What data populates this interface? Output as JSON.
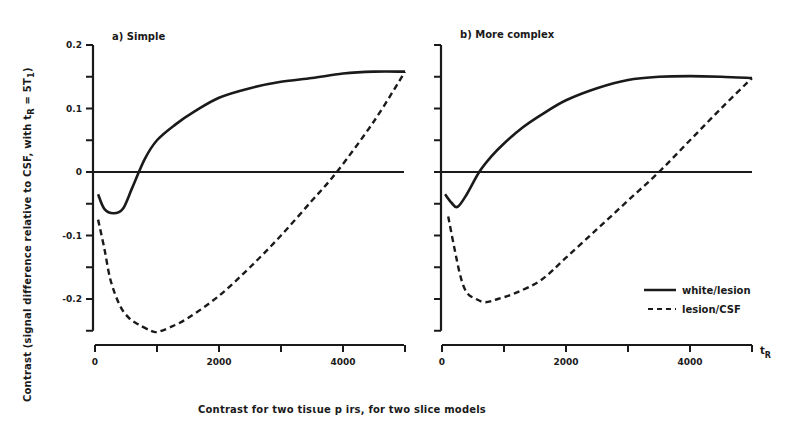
{
  "figure": {
    "caption": "Contrast for two tisɩue p irs, for two slice models",
    "ylabel": "Contrast (signal difference relative to CSF, with t",
    "ylabel_sub": "R",
    "ylabel_tail": " = 5T",
    "ylabel_sub2": "1",
    "ylabel_close": ")",
    "x_unit": "t",
    "x_unit_sub": "R"
  },
  "panels": [
    {
      "title": "a) Simple",
      "y_ticks": [
        "0.2",
        "0.1",
        "0",
        "-0.1",
        "-0.2"
      ],
      "x_ticks": [
        "0",
        "2000",
        "4000"
      ]
    },
    {
      "title": "b) More complex",
      "y_ticks": [],
      "x_ticks": [
        "0",
        "2000",
        "4000"
      ]
    }
  ],
  "legend": [
    {
      "label": "white/lesion",
      "style": "solid"
    },
    {
      "label": "lesion/CSF",
      "style": "dashed"
    }
  ],
  "colors": {
    "ink": "#1a1a1a",
    "background": "#ffffff"
  },
  "chart_data": [
    {
      "type": "line",
      "title": "a) Simple",
      "xlabel": "tR",
      "ylabel": "Contrast (signal difference relative to CSF, with tR = 5T1)",
      "xlim": [
        0,
        5000
      ],
      "ylim": [
        -0.25,
        0.2
      ],
      "x_ticks": [
        0,
        1000,
        2000,
        3000,
        4000,
        5000
      ],
      "x_tick_labels": [
        "0",
        "2000",
        "4000"
      ],
      "y_ticks": [
        -0.25,
        -0.2,
        -0.15,
        -0.1,
        -0.05,
        0,
        0.05,
        0.1,
        0.15,
        0.2
      ],
      "y_tick_labels": [
        "0.2",
        "0.1",
        "0",
        "-0.1",
        "-0.2"
      ],
      "grid": false,
      "reference_line": 0,
      "series": [
        {
          "name": "white/lesion",
          "style": "solid",
          "x": [
            50,
            150,
            300,
            450,
            600,
            800,
            1000,
            1300,
            1600,
            2000,
            2500,
            3000,
            3500,
            4000,
            4500,
            5000
          ],
          "y": [
            -0.035,
            -0.058,
            -0.065,
            -0.058,
            -0.025,
            0.02,
            0.05,
            0.075,
            0.095,
            0.117,
            0.132,
            0.142,
            0.148,
            0.155,
            0.158,
            0.158
          ]
        },
        {
          "name": "lesion/CSF",
          "style": "dashed",
          "x": [
            50,
            150,
            250,
            400,
            550,
            700,
            900,
            1000,
            1200,
            1500,
            2000,
            2500,
            3000,
            3500,
            3900,
            4500,
            5000
          ],
          "y": [
            -0.075,
            -0.12,
            -0.17,
            -0.21,
            -0.23,
            -0.24,
            -0.25,
            -0.252,
            -0.245,
            -0.23,
            -0.195,
            -0.15,
            -0.1,
            -0.045,
            0.0,
            0.08,
            0.158
          ]
        }
      ]
    },
    {
      "type": "line",
      "title": "b) More complex",
      "xlabel": "tR",
      "xlim": [
        0,
        5000
      ],
      "ylim": [
        -0.25,
        0.2
      ],
      "x_ticks": [
        0,
        1000,
        2000,
        3000,
        4000,
        5000
      ],
      "x_tick_labels": [
        "0",
        "2000",
        "4000"
      ],
      "grid": false,
      "reference_line": 0,
      "legend_position": "lower right",
      "series": [
        {
          "name": "white/lesion",
          "style": "solid",
          "x": [
            50,
            150,
            250,
            400,
            600,
            800,
            1000,
            1300,
            1600,
            2000,
            2500,
            3000,
            3500,
            4000,
            4500,
            5000
          ],
          "y": [
            -0.035,
            -0.048,
            -0.055,
            -0.035,
            0.0,
            0.025,
            0.045,
            0.07,
            0.09,
            0.113,
            0.132,
            0.145,
            0.15,
            0.151,
            0.15,
            0.148
          ]
        },
        {
          "name": "lesion/CSF",
          "style": "dashed",
          "x": [
            100,
            200,
            300,
            400,
            550,
            700,
            900,
            1200,
            1600,
            2000,
            2500,
            3000,
            3500,
            4000,
            4500,
            5000
          ],
          "y": [
            -0.07,
            -0.12,
            -0.165,
            -0.19,
            -0.2,
            -0.205,
            -0.2,
            -0.19,
            -0.17,
            -0.135,
            -0.09,
            -0.045,
            0.0,
            0.05,
            0.1,
            0.148
          ]
        }
      ]
    }
  ]
}
